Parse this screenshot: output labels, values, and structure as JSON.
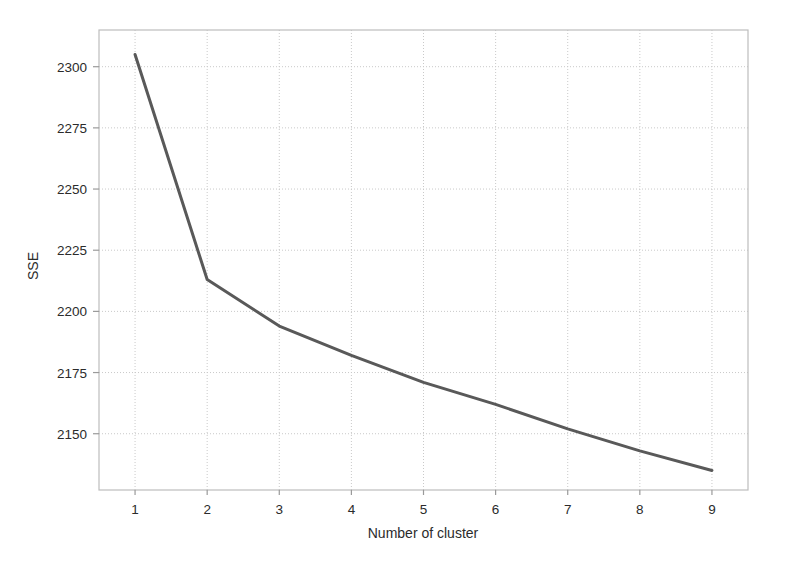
{
  "chart_data": {
    "type": "line",
    "title": "",
    "subtitle": "",
    "xlabel": "Number of cluster",
    "ylabel": "SSE",
    "x": [
      1,
      2,
      3,
      4,
      5,
      6,
      7,
      8,
      9
    ],
    "categories": [
      "1",
      "2",
      "3",
      "4",
      "5",
      "6",
      "7",
      "8",
      "9"
    ],
    "values": [
      2305,
      2213,
      2194,
      2182,
      2171,
      2162,
      2152,
      2143,
      2135
    ],
    "series": [
      {
        "name": "SSE",
        "values": [
          2305,
          2213,
          2194,
          2182,
          2171,
          2162,
          2152,
          2143,
          2135
        ]
      }
    ],
    "xlim": [
      0.5,
      9.5
    ],
    "ylim": [
      2127,
      2315
    ],
    "xticks": [
      1,
      2,
      3,
      4,
      5,
      6,
      7,
      8,
      9
    ],
    "xtick_labels": [
      "1",
      "2",
      "3",
      "4",
      "5",
      "6",
      "7",
      "8",
      "9"
    ],
    "yticks": [
      2150,
      2175,
      2200,
      2225,
      2250,
      2275,
      2300
    ],
    "ytick_labels": [
      "2150",
      "2175",
      "2200",
      "2225",
      "2250",
      "2275",
      "2300"
    ],
    "grid": true,
    "grid_color": "#c9c9c9",
    "legend": false,
    "legend_position": "none",
    "line_color": "#595959",
    "line_width": 3,
    "markers": false,
    "plot_background": "#ffffff",
    "frame_color": "#bdbdbd",
    "annotations": []
  }
}
